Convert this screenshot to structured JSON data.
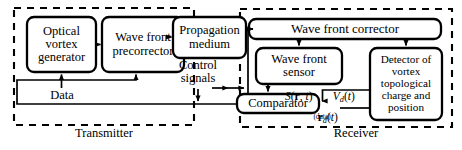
{
  "figure": {
    "type": "block-diagram",
    "stroke_color": "#000000",
    "background_color": "#ffffff",
    "dashed_group_color": "#000000"
  },
  "groups": [
    {
      "id": "transmitter",
      "label": "Transmitter",
      "style": "dashed"
    },
    {
      "id": "receiver",
      "label": "Receiver",
      "style": "dashed"
    }
  ],
  "blocks": [
    {
      "id": "optical-vortex-generator",
      "label": "Optical\nvortex\ngenerator",
      "lines": [
        "Optical",
        "vortex",
        "generator"
      ],
      "group": "transmitter"
    },
    {
      "id": "wave-front-precorrector",
      "label": "Wave front\nprecorrector",
      "lines": [
        "Wave front",
        "precorrector"
      ],
      "group": "transmitter"
    },
    {
      "id": "propagation-medium",
      "label": "Propagation\nmedium",
      "lines": [
        "Propagation",
        "medium"
      ],
      "group": "none"
    },
    {
      "id": "wave-front-corrector",
      "label": "Wave front corrector",
      "lines": [
        "Wave front corrector"
      ],
      "group": "receiver"
    },
    {
      "id": "wave-front-sensor",
      "label": "Wave front\nsensor",
      "lines": [
        "Wave front",
        "sensor"
      ],
      "group": "receiver"
    },
    {
      "id": "detector-of-vortex",
      "label": "Detector of\nvortex\ntopological\ncharge\nand position",
      "lines": [
        "Detector of",
        "vortex",
        "topological",
        "charge",
        "and position"
      ],
      "group": "receiver"
    },
    {
      "id": "comparator",
      "label": "Comparator",
      "lines": [
        "Comparator"
      ],
      "group": "receiver"
    }
  ],
  "signal_labels": [
    {
      "id": "data",
      "text": "Data"
    },
    {
      "id": "control-signals",
      "text": "Control\nsignals",
      "lines": [
        "Control",
        "signals"
      ]
    },
    {
      "id": "sensor-signal",
      "text": "S(r, t)",
      "parts": {
        "fn": "S",
        "open": "(",
        "vec": "r",
        "comma": ", ",
        "var": "t",
        "close": ")"
      }
    },
    {
      "id": "detector-voltage",
      "text": "Vd(t)",
      "parts": {
        "fn": "V",
        "subscript": "d",
        "open": "(",
        "var": "t",
        "close": ")"
      }
    },
    {
      "id": "detector-position",
      "text": "rd(t)",
      "parts": {
        "vec": "r",
        "subscript": "d",
        "open": "(",
        "var": "t",
        "close": ")"
      }
    },
    {
      "id": "data-note",
      "text": "(data)"
    }
  ]
}
